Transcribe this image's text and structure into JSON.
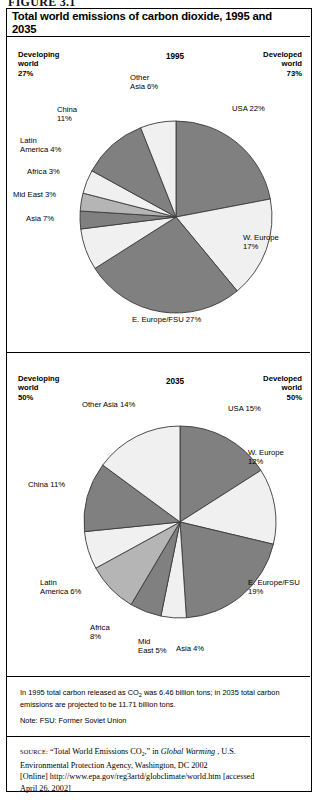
{
  "clipped_header": "FIGURE 3.1",
  "figure": {
    "title": "Total world emissions of carbon dioxide, 1995 and 2035"
  },
  "panels": [
    {
      "year_label": "1995",
      "left_annotation": "Developing\nworld\n27%",
      "right_annotation": "Developed\nworld\n73%"
    },
    {
      "year_label": "2035",
      "left_annotation": "Developing\nworld\n50%",
      "right_annotation": "Developed\nworld\n50%"
    }
  ],
  "footnotes": {
    "line1": "In 1995 total carbon released as CO",
    "line1_sub": "2",
    "line1_rest": " was 6.46 billion tons; in 2035 total carbon",
    "line2": "emissions are projected to be 11.71 billion tons.",
    "note": "Note: FSU: Former Soviet Union"
  },
  "source": {
    "label": "SOURCE:",
    "part1": " “Total World Emissions CO",
    "sub": "2",
    "part2": ",” in ",
    "italic": "Global Warming",
    "part3": " , U.S.",
    "line2": "Environmental Protection Agency, Washington, DC 2002",
    "line3": "[Online] http://www.epa.gov/reg3artd/globclimate/world.htm [accessed",
    "line4": "April 26, 2002]"
  },
  "colors": {
    "dark": "#808080",
    "medium": "#b5b5b5",
    "light": "#f0f0f0",
    "stroke": "#3a3a3a",
    "text": "#000000"
  },
  "chart_data": [
    {
      "type": "pie",
      "title": "1995",
      "legend": "labels around slices",
      "total_note": "Total carbon released as CO2 was 6.46 billion tons",
      "start_angle_deg": 0,
      "direction": "clockwise",
      "labels": [
        "USA 22%",
        "W. Europe 17%",
        "E. Europe/FSU 27%",
        "Asia 7%",
        "Mid East 3%",
        "Africa 3%",
        "Latin America 4%",
        "China 11%",
        "Other Asia 6%"
      ],
      "values": [
        22,
        17,
        27,
        7,
        3,
        3,
        4,
        11,
        6
      ],
      "fills": [
        "#808080",
        "#f0f0f0",
        "#808080",
        "#f0f0f0",
        "#808080",
        "#b5b5b5",
        "#f0f0f0",
        "#808080",
        "#f0f0f0"
      ]
    },
    {
      "type": "pie",
      "title": "2035",
      "legend": "labels around slices",
      "total_note": "Total carbon emissions projected to be 11.71 billion tons",
      "start_angle_deg": 0,
      "direction": "clockwise",
      "labels": [
        "USA 15%",
        "W. Europe 12%",
        "E. Europe/FSU 19%",
        "Asia 4%",
        "Mid East 5%",
        "Africa 8%",
        "Latin America 6%",
        "China 11%",
        "Other Asia 14%"
      ],
      "values": [
        15,
        12,
        19,
        4,
        5,
        8,
        6,
        11,
        14
      ],
      "fills": [
        "#808080",
        "#f0f0f0",
        "#808080",
        "#f0f0f0",
        "#808080",
        "#b5b5b5",
        "#f0f0f0",
        "#808080",
        "#f0f0f0"
      ]
    }
  ],
  "slice_labels_1995": [
    {
      "text": "USA 22%",
      "x": 232,
      "y": 104,
      "align": "left"
    },
    {
      "text": "W. Europe\n17%",
      "x": 243,
      "y": 233,
      "align": "left"
    },
    {
      "text": "E. Europe/FSU 27%",
      "x": 132,
      "y": 315,
      "align": "left"
    },
    {
      "text": "Asia 7%",
      "x": 26,
      "y": 214,
      "align": "left"
    },
    {
      "text": "Mid East 3%",
      "x": 13,
      "y": 190,
      "align": "left"
    },
    {
      "text": "Africa 3%",
      "x": 27,
      "y": 167,
      "align": "left"
    },
    {
      "text": "Latin\nAmerica 4%",
      "x": 20,
      "y": 136,
      "align": "left"
    },
    {
      "text": "China\n11%",
      "x": 57,
      "y": 105,
      "align": "left"
    },
    {
      "text": "Other\nAsia 6%",
      "x": 130,
      "y": 73,
      "align": "left"
    }
  ],
  "slice_labels_2035": [
    {
      "text": "USA 15%",
      "x": 228,
      "y": 404,
      "align": "left"
    },
    {
      "text": "W. Europe\n12%",
      "x": 248,
      "y": 448,
      "align": "left"
    },
    {
      "text": "E. Europe/FSU\n19%",
      "x": 248,
      "y": 578,
      "align": "left"
    },
    {
      "text": "Asia 4%",
      "x": 176,
      "y": 644,
      "align": "left"
    },
    {
      "text": "Mid\nEast 5%",
      "x": 138,
      "y": 637,
      "align": "left"
    },
    {
      "text": "Africa\n8%",
      "x": 90,
      "y": 623,
      "align": "left"
    },
    {
      "text": "Latin\nAmerica 6%",
      "x": 40,
      "y": 578,
      "align": "left"
    },
    {
      "text": "China 11%",
      "x": 28,
      "y": 480,
      "align": "left"
    },
    {
      "text": "Other Asia 14%",
      "x": 82,
      "y": 400,
      "align": "left"
    }
  ]
}
